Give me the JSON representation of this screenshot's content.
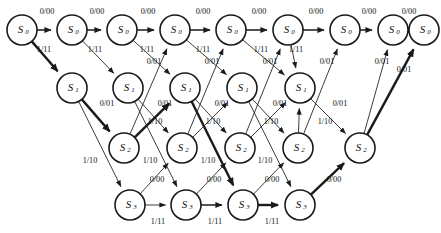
{
  "diagram": {
    "type": "trellis",
    "canvas": {
      "width": 441,
      "height": 233
    },
    "colors": {
      "stroke": "#1a1a1a",
      "fill": "#ffffff",
      "text": "#111111"
    },
    "state_names": [
      "S0",
      "S1",
      "S2",
      "S3"
    ],
    "state_base": [
      "S",
      "S",
      "S",
      "S"
    ],
    "state_subscripts": [
      "0",
      "1",
      "2",
      "3"
    ],
    "node_radius": 15,
    "nodes": [
      {
        "id": "a0",
        "state": 0,
        "base": "S",
        "sub": "0",
        "x": 22,
        "y": 30
      },
      {
        "id": "a1",
        "state": 0,
        "base": "S",
        "sub": "0",
        "x": 72,
        "y": 30
      },
      {
        "id": "a2",
        "state": 0,
        "base": "S",
        "sub": "0",
        "x": 122,
        "y": 30
      },
      {
        "id": "a3",
        "state": 0,
        "base": "S",
        "sub": "0",
        "x": 175,
        "y": 30
      },
      {
        "id": "a4",
        "state": 0,
        "base": "S",
        "sub": "0",
        "x": 231,
        "y": 30
      },
      {
        "id": "a5",
        "state": 0,
        "base": "S",
        "sub": "0",
        "x": 288,
        "y": 30
      },
      {
        "id": "a6",
        "state": 0,
        "base": "S",
        "sub": "0",
        "x": 345,
        "y": 30
      },
      {
        "id": "a7",
        "state": 0,
        "base": "S",
        "sub": "0",
        "x": 393,
        "y": 30
      },
      {
        "id": "a8",
        "state": 0,
        "base": "S",
        "sub": "0",
        "x": 424,
        "y": 30
      },
      {
        "id": "b1",
        "state": 1,
        "base": "S",
        "sub": "1",
        "x": 72,
        "y": 88
      },
      {
        "id": "b2",
        "state": 1,
        "base": "S",
        "sub": "1",
        "x": 128,
        "y": 88
      },
      {
        "id": "b3",
        "state": 1,
        "base": "S",
        "sub": "1",
        "x": 185,
        "y": 88
      },
      {
        "id": "b4",
        "state": 1,
        "base": "S",
        "sub": "1",
        "x": 242,
        "y": 88
      },
      {
        "id": "b5",
        "state": 1,
        "base": "S",
        "sub": "1",
        "x": 300,
        "y": 88
      },
      {
        "id": "c2",
        "state": 2,
        "base": "S",
        "sub": "2",
        "x": 124,
        "y": 148
      },
      {
        "id": "c3",
        "state": 2,
        "base": "S",
        "sub": "2",
        "x": 182,
        "y": 148
      },
      {
        "id": "c4",
        "state": 2,
        "base": "S",
        "sub": "2",
        "x": 240,
        "y": 148
      },
      {
        "id": "c5",
        "state": 2,
        "base": "S",
        "sub": "2",
        "x": 298,
        "y": 148
      },
      {
        "id": "c6",
        "state": 2,
        "base": "S",
        "sub": "2",
        "x": 360,
        "y": 148
      },
      {
        "id": "d3",
        "state": 3,
        "base": "S",
        "sub": "3",
        "x": 130,
        "y": 205
      },
      {
        "id": "d4",
        "state": 3,
        "base": "S",
        "sub": "3",
        "x": 186,
        "y": 205
      },
      {
        "id": "d5",
        "state": 3,
        "base": "S",
        "sub": "3",
        "x": 243,
        "y": 205
      },
      {
        "id": "d6",
        "state": 3,
        "base": "S",
        "sub": "3",
        "x": 300,
        "y": 205
      }
    ],
    "edges": [
      {
        "from": "a0",
        "to": "a1",
        "label": "0/00",
        "weight": "med",
        "lx": 47,
        "ly": 14,
        "input": "0",
        "output": "00"
      },
      {
        "from": "a1",
        "to": "a2",
        "label": "0/00",
        "weight": "med",
        "lx": 97,
        "ly": 14,
        "input": "0",
        "output": "00"
      },
      {
        "from": "a2",
        "to": "a3",
        "label": "0/00",
        "weight": "med",
        "lx": 148,
        "ly": 14,
        "input": "0",
        "output": "00"
      },
      {
        "from": "a3",
        "to": "a4",
        "label": "0/00",
        "weight": "med",
        "lx": 203,
        "ly": 14,
        "input": "0",
        "output": "00"
      },
      {
        "from": "a4",
        "to": "a5",
        "label": "0/00",
        "weight": "med",
        "lx": 259,
        "ly": 14,
        "input": "0",
        "output": "00"
      },
      {
        "from": "a5",
        "to": "a6",
        "label": "0/00",
        "weight": "med",
        "lx": 316,
        "ly": 14,
        "input": "0",
        "output": "00"
      },
      {
        "from": "a6",
        "to": "a7",
        "label": "0/00",
        "weight": "med",
        "lx": 369,
        "ly": 14,
        "input": "0",
        "output": "00"
      },
      {
        "from": "a7",
        "to": "a8",
        "label": "0/00",
        "weight": "med",
        "lx": 409,
        "ly": 14,
        "input": "0",
        "output": "00"
      },
      {
        "from": "a0",
        "to": "b1",
        "label": "1/11",
        "weight": "bold",
        "lx": 44,
        "ly": 52,
        "input": "1",
        "output": "11"
      },
      {
        "from": "a1",
        "to": "b2",
        "label": "1/11",
        "weight": "thin",
        "lx": 95,
        "ly": 52,
        "input": "1",
        "output": "11"
      },
      {
        "from": "a2",
        "to": "b3",
        "label": "1/11",
        "weight": "thin",
        "lx": 147,
        "ly": 52,
        "input": "1",
        "output": "11"
      },
      {
        "from": "a3",
        "to": "b4",
        "label": "1/11",
        "weight": "thin",
        "lx": 203,
        "ly": 52,
        "input": "1",
        "output": "11"
      },
      {
        "from": "a4",
        "to": "b5",
        "label": "1/11",
        "weight": "thin",
        "lx": 261,
        "ly": 52,
        "input": "1",
        "output": "11"
      },
      {
        "from": "a5",
        "to": "b5",
        "label": "1/11",
        "weight": "thin",
        "lx": 296,
        "ly": 52,
        "input": "1",
        "output": "11"
      },
      {
        "from": "b1",
        "to": "c2",
        "label": "0/01",
        "weight": "bold",
        "lx": 107,
        "ly": 106,
        "input": "0",
        "output": "01"
      },
      {
        "from": "b2",
        "to": "c3",
        "label": "0/01",
        "weight": "thin",
        "lx": 165,
        "ly": 106,
        "input": "0",
        "output": "01"
      },
      {
        "from": "b3",
        "to": "c4",
        "label": "0/01",
        "weight": "thin",
        "lx": 222,
        "ly": 106,
        "input": "0",
        "output": "01"
      },
      {
        "from": "b4",
        "to": "c5",
        "label": "0/01",
        "weight": "thin",
        "lx": 280,
        "ly": 106,
        "input": "0",
        "output": "01"
      },
      {
        "from": "b5",
        "to": "c6",
        "label": "0/01",
        "weight": "thin",
        "lx": 340,
        "ly": 106,
        "input": "0",
        "output": "01"
      },
      {
        "from": "b1",
        "to": "d3",
        "label": "1/10",
        "weight": "thin",
        "lx": 90,
        "ly": 163,
        "input": "1",
        "output": "10"
      },
      {
        "from": "b2",
        "to": "d4",
        "label": "1/10",
        "weight": "thin",
        "lx": 150,
        "ly": 163,
        "input": "1",
        "output": "10"
      },
      {
        "from": "b3",
        "to": "d5",
        "label": "1/10",
        "weight": "bold",
        "lx": 208,
        "ly": 163,
        "input": "1",
        "output": "10"
      },
      {
        "from": "b4",
        "to": "d6",
        "label": "1/10",
        "weight": "thin",
        "lx": 265,
        "ly": 163,
        "input": "1",
        "output": "10"
      },
      {
        "from": "c2",
        "to": "b3",
        "label": "1/10",
        "weight": "bold",
        "lx": 155,
        "ly": 124,
        "input": "1",
        "output": "10"
      },
      {
        "from": "c3",
        "to": "b4",
        "label": "1/10",
        "weight": "thin",
        "lx": 213,
        "ly": 124,
        "input": "1",
        "output": "10"
      },
      {
        "from": "c4",
        "to": "b5",
        "label": "1/10",
        "weight": "thin",
        "lx": 271,
        "ly": 124,
        "input": "1",
        "output": "10"
      },
      {
        "from": "c5",
        "to": "b5",
        "label": "1/10",
        "weight": "thin",
        "lx": 325,
        "ly": 124,
        "input": "1",
        "output": "10"
      },
      {
        "from": "c2",
        "to": "a3",
        "label": "0/01",
        "weight": "thin",
        "lx": 154,
        "ly": 64,
        "input": "0",
        "output": "01"
      },
      {
        "from": "c3",
        "to": "a4",
        "label": "0/01",
        "weight": "thin",
        "lx": 212,
        "ly": 64,
        "input": "0",
        "output": "01"
      },
      {
        "from": "c4",
        "to": "a5",
        "label": "0/01",
        "weight": "thin",
        "lx": 270,
        "ly": 64,
        "input": "0",
        "output": "01"
      },
      {
        "from": "c5",
        "to": "a6",
        "label": "0/01",
        "weight": "thin",
        "lx": 327,
        "ly": 64,
        "input": "0",
        "output": "01"
      },
      {
        "from": "c6",
        "to": "a7",
        "label": "0/01",
        "weight": "thin",
        "lx": 382,
        "ly": 64,
        "input": "0",
        "output": "01"
      },
      {
        "from": "d3",
        "to": "d4",
        "label": "1/11",
        "weight": "thin",
        "lx": 158,
        "ly": 224,
        "input": "1",
        "output": "11"
      },
      {
        "from": "d4",
        "to": "d5",
        "label": "1/11",
        "weight": "med",
        "lx": 215,
        "ly": 224,
        "input": "1",
        "output": "11"
      },
      {
        "from": "d5",
        "to": "d6",
        "label": "1/11",
        "weight": "bold",
        "lx": 272,
        "ly": 224,
        "input": "1",
        "output": "11"
      },
      {
        "from": "d3",
        "to": "c3",
        "label": "0/00",
        "weight": "thin",
        "lx": 157,
        "ly": 182,
        "input": "0",
        "output": "00"
      },
      {
        "from": "d4",
        "to": "c4",
        "label": "0/00",
        "weight": "thin",
        "lx": 214,
        "ly": 182,
        "input": "0",
        "output": "00"
      },
      {
        "from": "d5",
        "to": "c5",
        "label": "0/00",
        "weight": "thin",
        "lx": 272,
        "ly": 182,
        "input": "0",
        "output": "00"
      },
      {
        "from": "d6",
        "to": "c6",
        "label": "0/00",
        "weight": "bold",
        "lx": 334,
        "ly": 182,
        "input": "0",
        "output": "00"
      },
      {
        "from": "c6",
        "to": "a8",
        "label": "0/01",
        "weight": "bold",
        "lx": 404,
        "ly": 72,
        "input": "0",
        "output": "01"
      }
    ]
  }
}
